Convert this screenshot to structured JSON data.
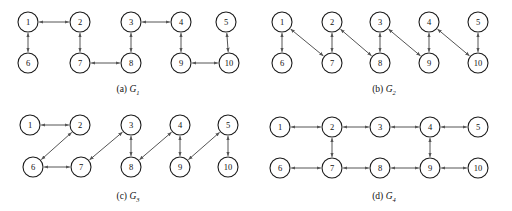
{
  "figure": {
    "type": "diagram",
    "node_radius": 10,
    "edge_style": "double-headed-arrow",
    "edge_color": "#555555",
    "node_stroke_color": "#1a1a1a",
    "node_fill_color": "#ffffff",
    "background_color": "#ffffff"
  },
  "panels": [
    {
      "id": "a",
      "caption_prefix": "(a)",
      "graph_name": "G",
      "graph_subscript": "1",
      "nodes": [
        {
          "label": "1",
          "x": 28,
          "y": 22
        },
        {
          "label": "2",
          "x": 80,
          "y": 22
        },
        {
          "label": "3",
          "x": 131,
          "y": 22
        },
        {
          "label": "4",
          "x": 181,
          "y": 22
        },
        {
          "label": "5",
          "x": 226,
          "y": 22
        },
        {
          "label": "6",
          "x": 28,
          "y": 63
        },
        {
          "label": "7",
          "x": 80,
          "y": 63
        },
        {
          "label": "8",
          "x": 131,
          "y": 63
        },
        {
          "label": "9",
          "x": 181,
          "y": 63
        },
        {
          "label": "10",
          "x": 229,
          "y": 63
        }
      ],
      "edges": [
        {
          "from": "1",
          "to": "2"
        },
        {
          "from": "1",
          "to": "6"
        },
        {
          "from": "2",
          "to": "7"
        },
        {
          "from": "7",
          "to": "8"
        },
        {
          "from": "3",
          "to": "8"
        },
        {
          "from": "3",
          "to": "4"
        },
        {
          "from": "4",
          "to": "9"
        },
        {
          "from": "9",
          "to": "10"
        },
        {
          "from": "5",
          "to": "10"
        }
      ]
    },
    {
      "id": "b",
      "caption_prefix": "(b)",
      "graph_name": "G",
      "graph_subscript": "2",
      "nodes": [
        {
          "label": "1",
          "x": 26,
          "y": 22
        },
        {
          "label": "2",
          "x": 76,
          "y": 22
        },
        {
          "label": "3",
          "x": 124,
          "y": 22
        },
        {
          "label": "4",
          "x": 173,
          "y": 22
        },
        {
          "label": "5",
          "x": 222,
          "y": 22
        },
        {
          "label": "6",
          "x": 26,
          "y": 63
        },
        {
          "label": "7",
          "x": 76,
          "y": 63
        },
        {
          "label": "8",
          "x": 124,
          "y": 63
        },
        {
          "label": "9",
          "x": 173,
          "y": 63
        },
        {
          "label": "10",
          "x": 222,
          "y": 63
        }
      ],
      "edges": [
        {
          "from": "1",
          "to": "6"
        },
        {
          "from": "2",
          "to": "7"
        },
        {
          "from": "3",
          "to": "8"
        },
        {
          "from": "4",
          "to": "9"
        },
        {
          "from": "5",
          "to": "10"
        },
        {
          "from": "1",
          "to": "7"
        },
        {
          "from": "2",
          "to": "8"
        },
        {
          "from": "3",
          "to": "9"
        },
        {
          "from": "4",
          "to": "10"
        }
      ]
    },
    {
      "id": "c",
      "caption_prefix": "(c)",
      "graph_name": "G",
      "graph_subscript": "3",
      "nodes": [
        {
          "label": "1",
          "x": 30,
          "y": 20
        },
        {
          "label": "2",
          "x": 80,
          "y": 20
        },
        {
          "label": "3",
          "x": 131,
          "y": 20
        },
        {
          "label": "4",
          "x": 180,
          "y": 20
        },
        {
          "label": "5",
          "x": 228,
          "y": 20
        },
        {
          "label": "6",
          "x": 33,
          "y": 62
        },
        {
          "label": "7",
          "x": 81,
          "y": 62
        },
        {
          "label": "8",
          "x": 131,
          "y": 62
        },
        {
          "label": "9",
          "x": 180,
          "y": 62
        },
        {
          "label": "10",
          "x": 228,
          "y": 62
        }
      ],
      "edges": [
        {
          "from": "1",
          "to": "2"
        },
        {
          "from": "2",
          "to": "6"
        },
        {
          "from": "6",
          "to": "7"
        },
        {
          "from": "7",
          "to": "3"
        },
        {
          "from": "3",
          "to": "8"
        },
        {
          "from": "4",
          "to": "8"
        },
        {
          "from": "4",
          "to": "9"
        },
        {
          "from": "9",
          "to": "5"
        },
        {
          "from": "5",
          "to": "10"
        }
      ]
    },
    {
      "id": "d",
      "caption_prefix": "(d)",
      "graph_name": "G",
      "graph_subscript": "4",
      "nodes": [
        {
          "label": "1",
          "x": 24,
          "y": 22
        },
        {
          "label": "2",
          "x": 76,
          "y": 22
        },
        {
          "label": "3",
          "x": 124,
          "y": 22
        },
        {
          "label": "4",
          "x": 174,
          "y": 22
        },
        {
          "label": "5",
          "x": 222,
          "y": 22
        },
        {
          "label": "6",
          "x": 24,
          "y": 63
        },
        {
          "label": "7",
          "x": 76,
          "y": 63
        },
        {
          "label": "8",
          "x": 124,
          "y": 63
        },
        {
          "label": "9",
          "x": 174,
          "y": 63
        },
        {
          "label": "10",
          "x": 222,
          "y": 63
        }
      ],
      "edges": [
        {
          "from": "1",
          "to": "2"
        },
        {
          "from": "2",
          "to": "3"
        },
        {
          "from": "3",
          "to": "4"
        },
        {
          "from": "4",
          "to": "5"
        },
        {
          "from": "6",
          "to": "7"
        },
        {
          "from": "7",
          "to": "8"
        },
        {
          "from": "8",
          "to": "9"
        },
        {
          "from": "9",
          "to": "10"
        },
        {
          "from": "2",
          "to": "7"
        },
        {
          "from": "4",
          "to": "9"
        }
      ]
    }
  ]
}
